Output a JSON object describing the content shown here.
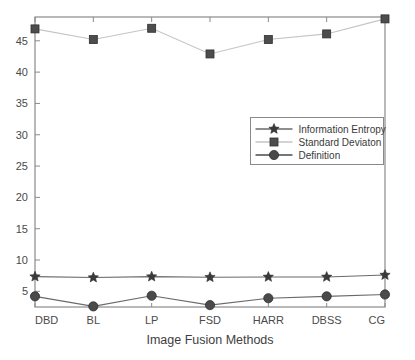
{
  "chart_data": {
    "type": "line",
    "title": "",
    "xlabel": "Image Fusion Methods",
    "ylabel": "",
    "categories": [
      "DBD",
      "BL",
      "LP",
      "FSD",
      "HARR",
      "DBSS",
      "CG"
    ],
    "series": [
      {
        "name": "Information Entropy",
        "marker": "star",
        "color": "#3a3a3a",
        "values": [
          7.35,
          7.2,
          7.35,
          7.25,
          7.3,
          7.3,
          7.6
        ]
      },
      {
        "name": "Standard Deviaton",
        "marker": "square",
        "color": "#4d4d4d",
        "values": [
          46.9,
          45.2,
          47.0,
          42.9,
          45.2,
          46.1,
          48.5
        ]
      },
      {
        "name": "Definition",
        "marker": "circle",
        "color": "#4a4a4a",
        "values": [
          4.2,
          2.6,
          4.3,
          2.8,
          3.9,
          4.2,
          4.5
        ]
      }
    ],
    "ylim": [
      2.5,
      48.8
    ],
    "yticks": [
      5,
      10,
      15,
      20,
      25,
      30,
      35,
      40,
      45
    ],
    "ytick_labels": [
      "5",
      "10",
      "15",
      "20",
      "25",
      "30",
      "35",
      "40",
      "45"
    ],
    "grid": false,
    "legend_position": "center-right"
  },
  "legend": {
    "entries": [
      {
        "label": "Information Entropy",
        "marker": "star"
      },
      {
        "label": "Standard Deviaton",
        "marker": "square"
      },
      {
        "label": "Definition",
        "marker": "circle"
      }
    ]
  },
  "axes": {
    "x_title": "Image Fusion Methods",
    "x_tick_labels": [
      "DBD",
      "BL",
      "LP",
      "FSD",
      "HARR",
      "DBSS",
      "CG"
    ],
    "y_tick_labels": [
      "45",
      "40",
      "35",
      "30",
      "25",
      "20",
      "15",
      "10",
      "5"
    ]
  },
  "colors": {
    "axis": "#8a8a8a",
    "series_entropy": "#3a3a3a",
    "series_std": "#9a9a9a",
    "series_definition": "#4a4a4a",
    "text": "#4a4a4a"
  }
}
